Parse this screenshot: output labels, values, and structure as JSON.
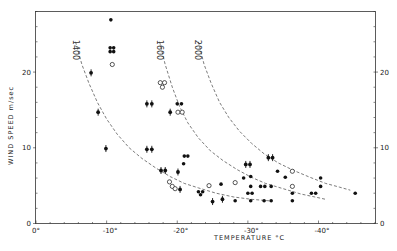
{
  "chart_data": {
    "type": "scatter",
    "title": "",
    "xlabel": "TEMPERATURE °C",
    "ylabel": "WIND SPEED m/sec",
    "xlim": [
      0,
      -48
    ],
    "ylim": [
      0,
      28
    ],
    "grid": false,
    "x_ticks": [
      {
        "value": 0,
        "label": "0°"
      },
      {
        "value": -10,
        "label": "-10°"
      },
      {
        "value": -20,
        "label": "-20°"
      },
      {
        "value": -30,
        "label": "-30°"
      },
      {
        "value": -40,
        "label": "-40°"
      }
    ],
    "y_ticks_left": [
      {
        "value": 0,
        "label": "0"
      },
      {
        "value": 10,
        "label": "10"
      },
      {
        "value": 20,
        "label": "20"
      }
    ],
    "y_ticks_right": [
      {
        "value": 0,
        "label": "0"
      },
      {
        "value": 10,
        "label": "10"
      },
      {
        "value": 20,
        "label": "20"
      }
    ],
    "curves": [
      {
        "name": "1400",
        "label": "1400",
        "style": "dashed",
        "points": [
          [
            -5.6,
            24
          ],
          [
            -6.5,
            21
          ],
          [
            -7.5,
            18.5
          ],
          [
            -8.7,
            16
          ],
          [
            -10,
            13.8
          ],
          [
            -11.5,
            11.8
          ],
          [
            -13.2,
            10
          ],
          [
            -15,
            8.6
          ],
          [
            -17,
            7.3
          ],
          [
            -19,
            6.2
          ],
          [
            -21,
            5.3
          ],
          [
            -23,
            4.7
          ],
          [
            -25.5,
            4
          ],
          [
            -28,
            3.5
          ],
          [
            -30.5,
            3.2
          ],
          [
            -33,
            3
          ]
        ]
      },
      {
        "name": "1600",
        "label": "1600",
        "style": "dashed",
        "points": [
          [
            -17.5,
            24
          ],
          [
            -18.3,
            21
          ],
          [
            -19.3,
            18
          ],
          [
            -20.3,
            15.5
          ],
          [
            -21.5,
            13.3
          ],
          [
            -23,
            11.3
          ],
          [
            -24.7,
            9.6
          ],
          [
            -26.5,
            8.3
          ],
          [
            -28.5,
            7.1
          ],
          [
            -30.5,
            6.1
          ],
          [
            -32.5,
            5.3
          ],
          [
            -35,
            4.6
          ],
          [
            -37.5,
            3.9
          ],
          [
            -39.5,
            3.5
          ],
          [
            -41,
            3.2
          ]
        ]
      },
      {
        "name": "2000",
        "label": "2000",
        "style": "dashed",
        "points": [
          [
            -23,
            24
          ],
          [
            -23.8,
            21
          ],
          [
            -24.8,
            18.5
          ],
          [
            -26,
            16
          ],
          [
            -27.3,
            14
          ],
          [
            -28.8,
            12.2
          ],
          [
            -30.5,
            10.6
          ],
          [
            -32.3,
            9.2
          ],
          [
            -34.3,
            8
          ],
          [
            -36.5,
            7
          ],
          [
            -38.8,
            6.1
          ],
          [
            -41,
            5.3
          ],
          [
            -43,
            4.8
          ],
          [
            -44.5,
            4.4
          ]
        ]
      }
    ],
    "series": [
      {
        "name": "filled",
        "marker": "filled-circle",
        "points": [
          [
            -10.6,
            26.9
          ],
          [
            -10.5,
            23.2
          ],
          [
            -11.0,
            23.2
          ],
          [
            -10.5,
            22.7
          ],
          [
            -11.0,
            22.7
          ],
          [
            -20.0,
            15.8
          ],
          [
            -20.6,
            15.8
          ],
          [
            -21.0,
            8.9
          ],
          [
            -21.5,
            8.9
          ],
          [
            -20.9,
            7.9
          ],
          [
            -23.0,
            4.2
          ],
          [
            -23.6,
            4.2
          ],
          [
            -23.3,
            3.8
          ],
          [
            -26.2,
            5.2
          ],
          [
            -28.2,
            3.0
          ],
          [
            -29.4,
            6.0
          ],
          [
            -30.4,
            6.2
          ],
          [
            -30.4,
            4.9
          ],
          [
            -30.0,
            4.0
          ],
          [
            -30.6,
            4.0
          ],
          [
            -30.4,
            3.0
          ],
          [
            -31.8,
            4.9
          ],
          [
            -32.4,
            4.9
          ],
          [
            -32.3,
            3.0
          ],
          [
            -33.3,
            3.0
          ],
          [
            -33.3,
            4.9
          ],
          [
            -34.2,
            6.9
          ],
          [
            -35.3,
            6.1
          ],
          [
            -36.3,
            4.0
          ],
          [
            -36.3,
            3.0
          ],
          [
            -39.0,
            4.0
          ],
          [
            -39.6,
            4.0
          ],
          [
            -40.3,
            6.0
          ],
          [
            -40.3,
            4.9
          ],
          [
            -45.2,
            4.0
          ]
        ]
      },
      {
        "name": "filled-with-bars",
        "marker": "filled-circle-errorbar",
        "points": [
          [
            -7.8,
            19.9
          ],
          [
            -8.8,
            14.7
          ],
          [
            -9.9,
            9.9
          ],
          [
            -15.7,
            15.8
          ],
          [
            -16.4,
            15.8
          ],
          [
            -15.7,
            9.8
          ],
          [
            -16.4,
            9.8
          ],
          [
            -19.0,
            14.7
          ],
          [
            -17.7,
            7.0
          ],
          [
            -18.3,
            7.0
          ],
          [
            -20.4,
            4.5
          ],
          [
            -20.1,
            6.8
          ],
          [
            -25.0,
            2.9
          ],
          [
            -26.4,
            3.2
          ],
          [
            -29.7,
            7.8
          ],
          [
            -30.3,
            7.8
          ],
          [
            -32.9,
            8.7
          ],
          [
            -33.5,
            8.7
          ]
        ]
      },
      {
        "name": "open",
        "marker": "open-circle",
        "points": [
          [
            -10.8,
            21.0
          ],
          [
            -17.6,
            18.6
          ],
          [
            -18.2,
            18.6
          ],
          [
            -17.9,
            18.0
          ],
          [
            -20.1,
            14.7
          ],
          [
            -20.7,
            14.7
          ],
          [
            -18.9,
            5.5
          ],
          [
            -19.3,
            4.9
          ],
          [
            -19.7,
            4.6
          ],
          [
            -24.5,
            5.0
          ],
          [
            -28.2,
            5.4
          ],
          [
            -36.3,
            6.9
          ],
          [
            -36.3,
            4.9
          ]
        ]
      }
    ]
  }
}
